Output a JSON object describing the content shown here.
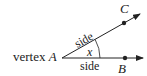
{
  "diagram": {
    "vertex_label_prefix": "vertex",
    "vertex_name": "A",
    "point_c": "C",
    "point_b": "B",
    "side_upper": "side",
    "side_lower": "side",
    "angle_label": "x",
    "color": "#222222"
  }
}
